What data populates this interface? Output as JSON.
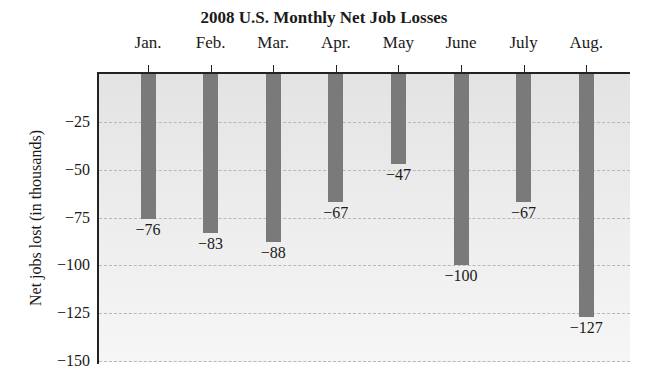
{
  "chart_data": {
    "type": "bar",
    "title": "2008 U.S. Monthly Net Job Losses",
    "categories": [
      "Jan.",
      "Feb.",
      "Mar.",
      "Apr.",
      "May",
      "June",
      "July",
      "Aug."
    ],
    "values": [
      -76,
      -83,
      -88,
      -67,
      -47,
      -100,
      -67,
      -127
    ],
    "data_labels": [
      "−76",
      "−83",
      "−88",
      "−67",
      "−47",
      "−100",
      "−67",
      "−127"
    ],
    "xlabel": "",
    "ylabel": "Net jobs lost (in thousands)",
    "ylim": [
      -150,
      0
    ],
    "yticks": [
      -25,
      -50,
      -75,
      -100,
      -125,
      -150
    ],
    "ytick_labels": [
      "−25",
      "−50",
      "−75",
      "−100",
      "−125",
      "−150"
    ],
    "x_axis_position": "top",
    "grid": true,
    "legend": null,
    "bar_color": "#7a7a7a"
  }
}
